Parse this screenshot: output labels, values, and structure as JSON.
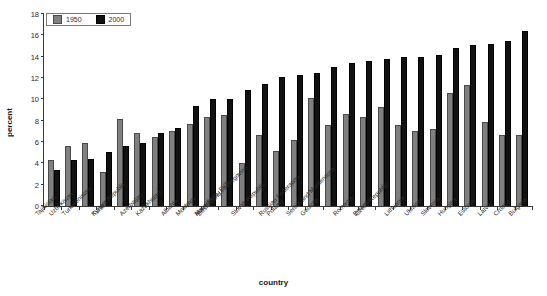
{
  "chart_data": {
    "type": "bar",
    "title": "",
    "xlabel": "country",
    "ylabel": "percent",
    "ylim": [
      0,
      18
    ],
    "ytick_step": 2,
    "yticks": [
      0,
      2,
      4,
      6,
      8,
      10,
      12,
      14,
      16,
      18
    ],
    "grid": false,
    "legend_position": "top-left",
    "categories": [
      "Tajikistan",
      "Uzbekistan",
      "Turkmenistan",
      "Turkey",
      "Kyrgyz Republic",
      "Azerbaijan",
      "Kazakhstan",
      "Albania",
      "Moldova",
      "Armenia",
      "Macedonia, FYR",
      "Bosnia and Herzegovina",
      "Slovak Republic",
      "Poland",
      "Russian Federation",
      "Georgia",
      "Serbia and Montenegro",
      "Romania",
      "Belarus",
      "Czech Republic",
      "Lithuania",
      "Ukraine",
      "Slovenia",
      "Hungary",
      "Estonia",
      "Latvia",
      "Croatia",
      "Bulgaria"
    ],
    "series": [
      {
        "name": "1950",
        "color": "#808080",
        "values": [
          4.3,
          5.6,
          5.9,
          3.2,
          8.2,
          6.8,
          6.5,
          7.0,
          7.7,
          8.3,
          8.5,
          4.0,
          6.7,
          5.2,
          6.2,
          10.1,
          7.6,
          8.6,
          8.3,
          9.3,
          7.6,
          7.0,
          7.2,
          10.6,
          11.3,
          7.9,
          6.7,
          6.7
        ]
      },
      {
        "name": "2000",
        "color": "#111111",
        "values": [
          3.4,
          4.3,
          4.4,
          5.1,
          5.6,
          5.9,
          6.8,
          7.3,
          9.4,
          10.0,
          10.0,
          10.9,
          11.4,
          12.1,
          12.3,
          12.5,
          13.0,
          13.4,
          13.6,
          13.8,
          14.0,
          14.0,
          14.2,
          14.8,
          15.1,
          15.2,
          15.5,
          16.4
        ]
      }
    ]
  },
  "legend": {
    "items": [
      {
        "label": "1950",
        "swatch": "s1950"
      },
      {
        "label": "2000",
        "swatch": "s2000"
      }
    ]
  },
  "axes": {
    "y_title": "percent",
    "x_title": "country"
  }
}
